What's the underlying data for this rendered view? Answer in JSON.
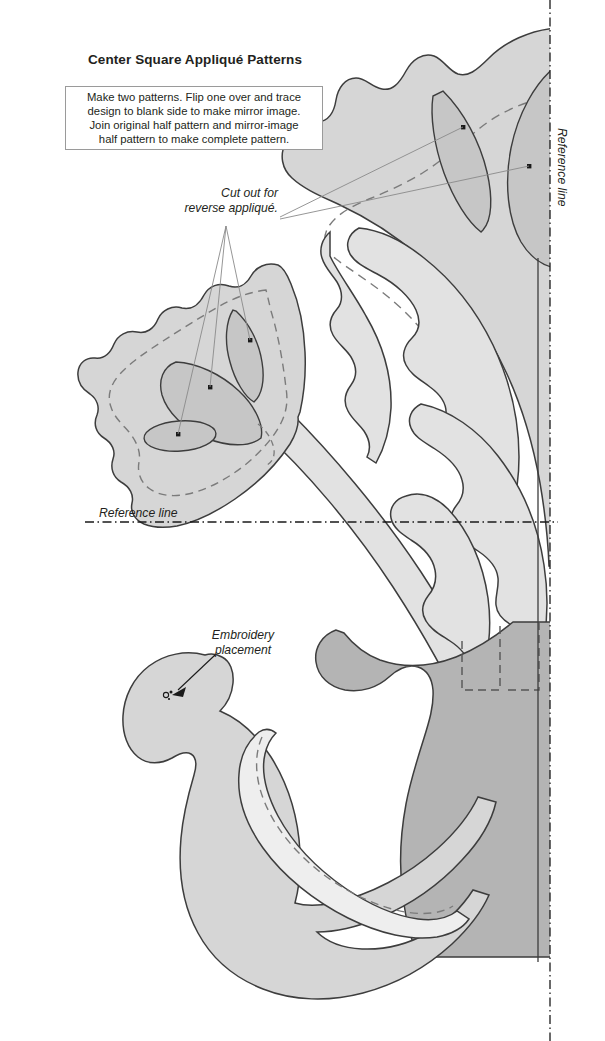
{
  "document": {
    "title": "Center Square Appliqué Patterns",
    "instructions": "Make two patterns. Flip one over and trace\ndesign to blank side to make mirror image.\nJoin original half pattern and mirror-image\nhalf pattern to make complete pattern."
  },
  "annotations": {
    "cut_out": "Cut out for\nreverse appliqué.",
    "embroidery": "Embroidery\nplacement",
    "reference_line_horizontal": "Reference line",
    "reference_line_vertical": "Reference line"
  },
  "colors": {
    "background": "#ffffff",
    "ink": "#231f20",
    "outline": "#3d3d3d",
    "fill_light": "#e2e2e2",
    "fill_medium": "#d6d6d6",
    "fill_dark": "#b4b4b4",
    "fill_inner": "#c6c6c6",
    "fill_pale": "#eeeeee",
    "leader_line": "#8a8a8a",
    "box_border": "#9a9a9a"
  },
  "pattern_elements": [
    {
      "name": "top-flower",
      "fill": "#d6d6d6",
      "has_dashed_seam": true,
      "inner_cutouts": 2
    },
    {
      "name": "left-flower",
      "fill": "#d6d6d6",
      "has_dashed_seam": true,
      "inner_cutouts": 3
    },
    {
      "name": "stem",
      "fill": "#e2e2e2",
      "has_dashed_seam": false
    },
    {
      "name": "leaf-upper",
      "fill": "#e2e2e2",
      "has_dashed_seam": false
    },
    {
      "name": "leaf-middle",
      "fill": "#e2e2e2",
      "has_dashed_seam": false
    },
    {
      "name": "leaf-lower",
      "fill": "#e2e2e2",
      "has_dashed_seam": false
    },
    {
      "name": "background-leaf-large",
      "fill": "#b4b4b4",
      "has_dashed_seam": true
    },
    {
      "name": "bird-body",
      "fill": "#d6d6d6",
      "has_dashed_seam": false
    },
    {
      "name": "bird-wing",
      "fill": "#eeeeee",
      "has_dashed_seam": true
    },
    {
      "name": "bird-eye",
      "fill": "#231f20",
      "has_dashed_seam": false
    }
  ],
  "reference_lines": {
    "horizontal_y": 522,
    "vertical_x": 550,
    "style": "dash-dot"
  }
}
